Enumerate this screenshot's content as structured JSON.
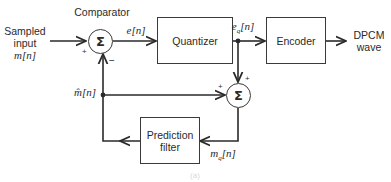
{
  "diagram": {
    "type": "block-diagram",
    "input": {
      "line1": "Sampled",
      "line2": "input",
      "signal": "m[n]"
    },
    "output": {
      "line1": "DPCM",
      "line2": "wave"
    },
    "comparator": {
      "label": "Comparator",
      "symbol": "Σ",
      "plus": "+",
      "minus": "−"
    },
    "quantizer": {
      "label": "Quantizer"
    },
    "encoder": {
      "label": "Encoder"
    },
    "adder": {
      "symbol": "Σ",
      "plus_top": "+",
      "plus_left": "+"
    },
    "prediction_filter": {
      "line1": "Prediction",
      "line2": "filter"
    },
    "signals": {
      "error": "e[n]",
      "quantized_error": "e_q[n]",
      "eq_base": "e",
      "eq_sub": "q",
      "eq_tail": "[n]",
      "prediction": "m̂[n]",
      "reconstructed": "m_q[n]",
      "mq_base": "m",
      "mq_sub": "q",
      "mq_tail": "[n]"
    },
    "caption": "(a)",
    "colors": {
      "line": "#2a2a2a",
      "box_border": "#3a3a3a",
      "background": "#ffffff"
    }
  }
}
